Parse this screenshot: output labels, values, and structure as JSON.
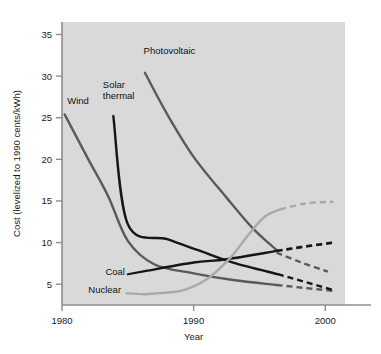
{
  "chart_data": {
    "type": "line",
    "title": "",
    "xlabel": "Year",
    "ylabel": "Cost (levelized to 1990 cents/kWh)",
    "xlim": [
      1980,
      2001.5
    ],
    "ylim": [
      2.5,
      36.5
    ],
    "xticks": [
      1980,
      1990,
      2000
    ],
    "xtick_labels": [
      "1980",
      "1990",
      "2000"
    ],
    "yticks": [
      5,
      10,
      15,
      20,
      25,
      30,
      35
    ],
    "ytick_labels": [
      "5",
      "10",
      "15",
      "20",
      "25",
      "30",
      "35"
    ],
    "grid": false,
    "legend": "inline-labels",
    "background": "#d9d9d9",
    "series": [
      {
        "name": "Wind",
        "color": "#5a5a5a",
        "label": "Wind",
        "label_x": 1980.4,
        "label_y": 26.6,
        "solid": [
          {
            "x": 1980.2,
            "y": 25.4
          },
          {
            "x": 1982.0,
            "y": 20.0
          },
          {
            "x": 1983.5,
            "y": 15.6
          },
          {
            "x": 1985.0,
            "y": 10.2
          },
          {
            "x": 1987.0,
            "y": 7.4
          },
          {
            "x": 1990.0,
            "y": 6.3
          },
          {
            "x": 1993.0,
            "y": 5.5
          },
          {
            "x": 1996.3,
            "y": 4.9
          }
        ],
        "dashed": [
          {
            "x": 1996.3,
            "y": 4.9
          },
          {
            "x": 2000.6,
            "y": 4.2
          }
        ]
      },
      {
        "name": "Solar thermal",
        "color": "#161616",
        "label": "Solar\nthermal",
        "label_x": 1983.1,
        "label_y": 28.6,
        "solid": [
          {
            "x": 1983.9,
            "y": 25.2
          },
          {
            "x": 1985.0,
            "y": 12.2
          },
          {
            "x": 1988.0,
            "y": 10.4
          },
          {
            "x": 1990.5,
            "y": 9.0
          },
          {
            "x": 1993.0,
            "y": 7.6
          },
          {
            "x": 1996.4,
            "y": 6.2
          }
        ],
        "dashed": [
          {
            "x": 1996.4,
            "y": 6.2
          },
          {
            "x": 2000.6,
            "y": 4.3
          }
        ]
      },
      {
        "name": "Photovoltaic",
        "color": "#5a5a5a",
        "label": "Photovoltaic",
        "label_x": 1986.2,
        "label_y": 32.6,
        "solid": [
          {
            "x": 1986.3,
            "y": 30.4
          },
          {
            "x": 1988.0,
            "y": 25.4
          },
          {
            "x": 1990.0,
            "y": 20.3
          },
          {
            "x": 1992.5,
            "y": 15.4
          },
          {
            "x": 1994.5,
            "y": 11.7
          },
          {
            "x": 1996.3,
            "y": 9.1
          }
        ],
        "dashed_upper": [
          {
            "x": 1996.3,
            "y": 9.0
          },
          {
            "x": 1998.2,
            "y": 9.5
          },
          {
            "x": 2000.6,
            "y": 10.0
          }
        ],
        "dashed_lower": [
          {
            "x": 1996.3,
            "y": 8.8
          },
          {
            "x": 1998.2,
            "y": 7.6
          },
          {
            "x": 2000.2,
            "y": 6.5
          }
        ]
      },
      {
        "name": "Coal",
        "color": "#161616",
        "label": "Coal",
        "label_x": 1983.3,
        "label_y": 6.1,
        "leader_from": {
          "x": 1985.0,
          "y": 6.2
        },
        "leader_to": {
          "x": 1986.4,
          "y": 6.6
        },
        "solid": [
          {
            "x": 1986.4,
            "y": 6.6
          },
          {
            "x": 1990.0,
            "y": 7.6
          },
          {
            "x": 1992.5,
            "y": 8.0
          },
          {
            "x": 1996.3,
            "y": 9.0
          }
        ],
        "dashed": [
          {
            "x": 1996.3,
            "y": 9.0
          },
          {
            "x": 2000.6,
            "y": 10.0
          }
        ]
      },
      {
        "name": "Nuclear",
        "color": "#a9a9a9",
        "label": "Nuclear",
        "label_x": 1982.0,
        "label_y": 3.9,
        "leader_from": {
          "x": 1984.9,
          "y": 3.9
        },
        "leader_to": {
          "x": 1986.2,
          "y": 3.8
        },
        "solid": [
          {
            "x": 1986.2,
            "y": 3.8
          },
          {
            "x": 1989.0,
            "y": 4.2
          },
          {
            "x": 1991.0,
            "y": 5.6
          },
          {
            "x": 1992.8,
            "y": 8.2
          },
          {
            "x": 1994.2,
            "y": 11.0
          },
          {
            "x": 1995.4,
            "y": 13.1
          },
          {
            "x": 1996.6,
            "y": 14.0
          }
        ],
        "dashed": [
          {
            "x": 1996.6,
            "y": 14.0
          },
          {
            "x": 1998.5,
            "y": 14.7
          },
          {
            "x": 2000.6,
            "y": 14.9
          }
        ]
      }
    ]
  }
}
